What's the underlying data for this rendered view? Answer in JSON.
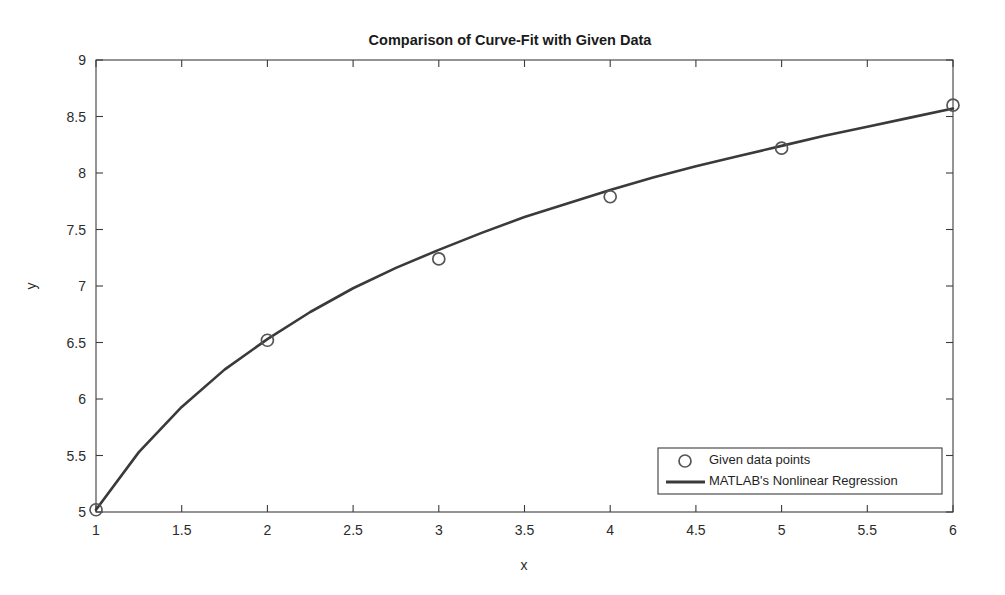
{
  "chart_data": {
    "type": "line",
    "title": "Comparison of Curve-Fit with Given Data",
    "xlabel": "x",
    "ylabel": "y",
    "xlim": [
      1,
      6
    ],
    "ylim": [
      5,
      9
    ],
    "grid": false,
    "legend_position": "lower-right",
    "xticks": [
      "1",
      "1.5",
      "2",
      "2.5",
      "3",
      "3.5",
      "4",
      "4.5",
      "5",
      "5.5",
      "6"
    ],
    "xtick_values": [
      1,
      1.5,
      2,
      2.5,
      3,
      3.5,
      4,
      4.5,
      5,
      5.5,
      6
    ],
    "yticks": [
      "5",
      "5.5",
      "6",
      "6.5",
      "7",
      "7.5",
      "8",
      "8.5",
      "9"
    ],
    "ytick_values": [
      5,
      5.5,
      6,
      6.5,
      7,
      7.5,
      8,
      8.5,
      9
    ],
    "series": [
      {
        "name": "Given data points",
        "type": "scatter",
        "marker": "circle-open",
        "color": "#555555",
        "x": [
          1,
          2,
          3,
          4,
          5,
          6
        ],
        "values": [
          5.02,
          6.52,
          7.24,
          7.79,
          8.22,
          8.6
        ]
      },
      {
        "name": "MATLAB's Nonlinear Regression",
        "type": "line",
        "color": "#3a3a3a",
        "x": [
          1,
          1.25,
          1.5,
          1.75,
          2,
          2.25,
          2.5,
          2.75,
          3,
          3.25,
          3.5,
          3.75,
          4,
          4.25,
          4.5,
          4.75,
          5,
          5.25,
          5.5,
          5.75,
          6
        ],
        "values": [
          5.02,
          5.53,
          5.93,
          6.26,
          6.53,
          6.77,
          6.98,
          7.16,
          7.32,
          7.47,
          7.61,
          7.73,
          7.85,
          7.96,
          8.06,
          8.15,
          8.24,
          8.33,
          8.41,
          8.49,
          8.57
        ]
      }
    ]
  },
  "legend": {
    "entries": [
      {
        "label": "Given data points",
        "glyph": "circle-open-icon"
      },
      {
        "label": "MATLAB's Nonlinear Regression",
        "glyph": "line-segment-icon"
      }
    ]
  }
}
